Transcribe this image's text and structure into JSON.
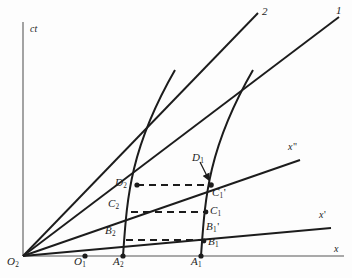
{
  "figure": {
    "kind": "minkowski-spacetime-diagram",
    "width": 352,
    "height": 278,
    "background": "#fdfdfd",
    "ink": "#1c1c1c",
    "axis_color": "#8c8c8c"
  },
  "axes": {
    "vertical": {
      "label": "ct",
      "x": 23,
      "top": 22,
      "bottom": 256
    },
    "horizontal": {
      "label": "x",
      "y": 256,
      "left": 23,
      "right": 344
    }
  },
  "origin": {
    "label": "O",
    "sub": "2",
    "x": 23,
    "y": 256
  },
  "ray_labels": {
    "worldline_2": "2",
    "worldline_1": "1",
    "x_double_prime": "x",
    "x_double_prime_mark": "\"",
    "x_prime": "x",
    "x_prime_mark": "'"
  },
  "points": [
    {
      "name": "O2",
      "base": "O",
      "sub": "2",
      "x": 23,
      "y": 256,
      "dot": false,
      "label_x": 9,
      "label_y": 258
    },
    {
      "name": "O1",
      "base": "O",
      "sub": "1",
      "x": 85,
      "y": 256,
      "dot": true,
      "label_x": 76,
      "label_y": 258
    },
    {
      "name": "A2",
      "base": "A",
      "sub": "2",
      "x": 123,
      "y": 256,
      "dot": true,
      "label_x": 115,
      "label_y": 258
    },
    {
      "name": "A1",
      "base": "A",
      "sub": "1",
      "x": 201,
      "y": 256,
      "dot": true,
      "label_x": 193,
      "label_y": 258
    },
    {
      "name": "B2",
      "base": "B",
      "sub": "2",
      "x": 126,
      "y": 240,
      "dot": false,
      "label_x": 107,
      "label_y": 226
    },
    {
      "name": "B1",
      "base": "B",
      "sub": "1",
      "x": 204,
      "y": 241,
      "dot": true,
      "label_x": 209,
      "label_y": 237
    },
    {
      "name": "B1p",
      "base": "B",
      "sub": "1",
      "prime": "'",
      "x": 205,
      "y": 233,
      "dot": false,
      "label_x": 207,
      "label_y": 222
    },
    {
      "name": "C2",
      "base": "C",
      "sub": "2",
      "x": 131,
      "y": 212,
      "dot": false,
      "label_x": 110,
      "label_y": 199
    },
    {
      "name": "C1",
      "base": "C",
      "sub": "1",
      "x": 206,
      "y": 212,
      "dot": true,
      "label_x": 211,
      "label_y": 206
    },
    {
      "name": "D2",
      "base": "D",
      "sub": "2",
      "x": 137,
      "y": 185,
      "dot": true,
      "label_x": 117,
      "label_y": 178
    },
    {
      "name": "C1p",
      "base": "C",
      "sub": "1",
      "prime": "'",
      "x": 211,
      "y": 185,
      "dot": true,
      "label_x": 213,
      "label_y": 188
    },
    {
      "name": "D1",
      "base": "D",
      "sub": "1",
      "x": 211,
      "y": 185,
      "dot": false,
      "label_x": 193,
      "label_y": 154
    }
  ],
  "rays_from_origin": [
    {
      "name": "worldline-2",
      "x1": 23,
      "y1": 256,
      "x2": 258,
      "y2": 13,
      "width": 1.9,
      "label": "2",
      "label_x": 262,
      "label_y": 9
    },
    {
      "name": "worldline-1",
      "x1": 23,
      "y1": 256,
      "x2": 339,
      "y2": 17,
      "width": 1.9,
      "label": "1",
      "label_x": 337,
      "label_y": 8
    },
    {
      "name": "x-double-prime-axis",
      "x1": 23,
      "y1": 256,
      "x2": 300,
      "y2": 160,
      "width": 1.9,
      "label": "x\"",
      "label_x": 288,
      "label_y": 143
    },
    {
      "name": "x-prime-axis",
      "x1": 23,
      "y1": 256,
      "x2": 331,
      "y2": 228,
      "width": 1.9,
      "label": "x'",
      "label_x": 318,
      "label_y": 211
    }
  ],
  "worldlines": [
    {
      "name": "worldline-from-A2",
      "from_x": 123,
      "from_y": 256,
      "cx": 133,
      "cy": 140,
      "to_x": 175,
      "to_y": 70,
      "width": 2.0
    },
    {
      "name": "worldline-from-A1",
      "from_x": 201,
      "from_y": 256,
      "cx": 211,
      "cy": 140,
      "to_x": 253,
      "to_y": 70,
      "width": 2.0
    }
  ],
  "dashed_connectors": [
    {
      "name": "dashed-B2-B1",
      "x1": 126,
      "y1": 240,
      "x2": 204,
      "y2": 240
    },
    {
      "name": "dashed-C2-C1",
      "x1": 131,
      "y1": 212,
      "x2": 206,
      "y2": 212
    },
    {
      "name": "dashed-D2-C1prime",
      "x1": 137,
      "y1": 185,
      "x2": 210,
      "y2": 185
    }
  ],
  "annotation_arrow": {
    "name": "arrow-D1-to-C1prime",
    "from_x": 200,
    "from_y": 162,
    "to_x": 210,
    "to_y": 181
  }
}
